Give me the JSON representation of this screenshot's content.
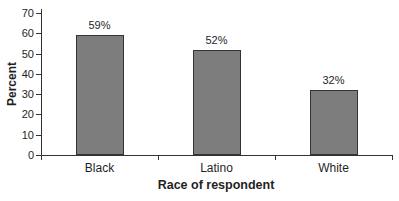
{
  "chart_data": {
    "type": "bar",
    "title": "",
    "categories": [
      "Black",
      "Latino",
      "White"
    ],
    "values": [
      59,
      52,
      32
    ],
    "bar_labels": [
      "59%",
      "52%",
      "32%"
    ],
    "xlabel": "Race of respondent",
    "ylabel": "Percent",
    "ylim": [
      0,
      70
    ],
    "yticks": [
      0,
      10,
      20,
      30,
      40,
      50,
      60,
      70
    ],
    "grid": "off",
    "legend": "none",
    "bar_color": "#7d7d7d",
    "bar_border_color": "#333333",
    "axis_color": "#333333",
    "text_color": "#1f1f1f",
    "background": "#ffffff"
  }
}
